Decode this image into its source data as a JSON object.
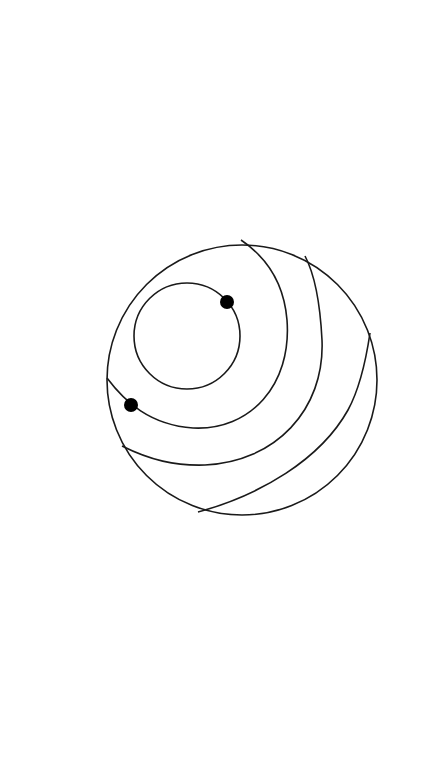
{
  "diagram": {
    "colors": {
      "background": "#ffffff",
      "stroke": "#1a1a1a",
      "dot": "#000000"
    },
    "outer_circle": {
      "cx": 242,
      "cy": 380,
      "r": 135
    },
    "inner_circle": {
      "cx": 187,
      "cy": 336,
      "r": 53
    },
    "arcs": [
      {
        "name": "band-arc-1",
        "path": "M 107 378 C 125 402, 150 425, 193 428 C 250 431, 292 385, 287 320 C 284 283, 266 257, 241 240"
      },
      {
        "name": "band-arc-2",
        "path": "M 122 446 C 150 460, 175 466, 205 465 C 275 462, 325 410, 322 340 C 320 300, 315 275, 305 256"
      },
      {
        "name": "band-arc-3",
        "path": "M 198 512 C 260 495, 320 460, 348 410 C 360 388, 366 360, 370 333"
      }
    ],
    "dots": [
      {
        "name": "dot-inner-circle",
        "cx": 227,
        "cy": 302,
        "r": 7
      },
      {
        "name": "dot-band-arc",
        "cx": 131,
        "cy": 405,
        "r": 7
      }
    ]
  }
}
